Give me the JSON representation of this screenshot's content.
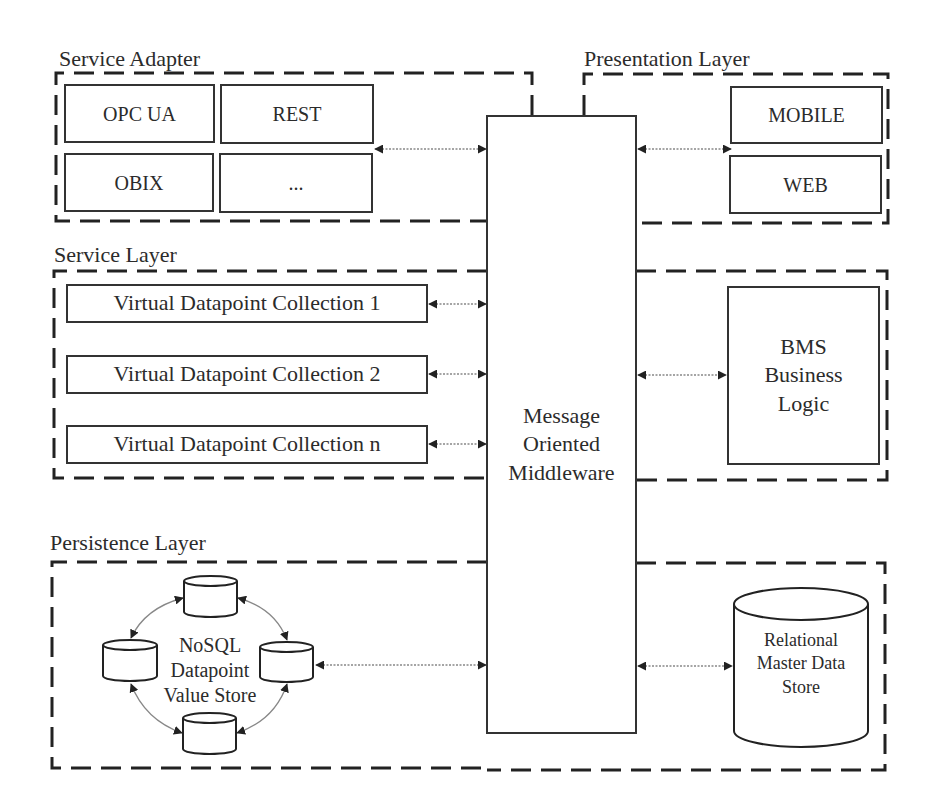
{
  "diagram": {
    "layers": {
      "service_adapter": {
        "title": "Service Adapter",
        "items": [
          "OPC UA",
          "REST",
          "OBIX",
          "..."
        ]
      },
      "presentation": {
        "title": "Presentation Layer",
        "items": [
          "MOBILE",
          "WEB"
        ]
      },
      "service": {
        "title": "Service Layer",
        "items": [
          "Virtual Datapoint Collection 1",
          "Virtual Datapoint Collection 2",
          "Virtual Datapoint Collection n"
        ],
        "logic": "BMS Business Logic",
        "logic_lines": [
          "BMS",
          "Business",
          "Logic"
        ]
      },
      "persistence": {
        "title": "Persistence Layer",
        "nosql_lines": [
          "NoSQL",
          "Datapoint",
          "Value Store"
        ],
        "relational_lines": [
          "Relational",
          "Master Data",
          "Store"
        ]
      }
    },
    "middleware": {
      "lines": [
        "Message",
        "Oriented",
        "Middleware"
      ]
    },
    "connections": [
      {
        "from": "Service Adapter",
        "to": "Message Oriented Middleware",
        "type": "bidirectional"
      },
      {
        "from": "Message Oriented Middleware",
        "to": "Presentation Layer",
        "type": "bidirectional"
      },
      {
        "from": "Virtual Datapoint Collection 1",
        "to": "Message Oriented Middleware",
        "type": "bidirectional"
      },
      {
        "from": "Virtual Datapoint Collection 2",
        "to": "Message Oriented Middleware",
        "type": "bidirectional"
      },
      {
        "from": "Virtual Datapoint Collection n",
        "to": "Message Oriented Middleware",
        "type": "bidirectional"
      },
      {
        "from": "Message Oriented Middleware",
        "to": "BMS Business Logic",
        "type": "bidirectional"
      },
      {
        "from": "NoSQL Datapoint Value Store",
        "to": "Message Oriented Middleware",
        "type": "bidirectional"
      },
      {
        "from": "Message Oriented Middleware",
        "to": "Relational Master Data Store",
        "type": "bidirectional"
      }
    ],
    "colors": {
      "stroke": "#333333",
      "text": "#2b2b2b",
      "connector": "#888888",
      "background": "#ffffff"
    }
  }
}
